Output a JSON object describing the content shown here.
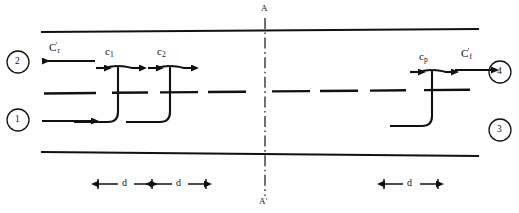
{
  "figure": {
    "type": "engineering-schematic",
    "background": "#fefefe",
    "ink": "#111111"
  },
  "section_line": {
    "top_label": "A",
    "bottom_label": "A'",
    "style": "dash-dot"
  },
  "stations": [
    {
      "id": "station-2",
      "number": "2",
      "cx": 18,
      "cy": 62,
      "r": 11
    },
    {
      "id": "station-1",
      "number": "1",
      "cx": 18,
      "cy": 120,
      "r": 11
    },
    {
      "id": "station-4",
      "number": "4",
      "cx": 500,
      "cy": 72,
      "r": 11
    },
    {
      "id": "station-3",
      "number": "3",
      "cx": 500,
      "cy": 130,
      "r": 11
    }
  ],
  "velocity_labels": [
    {
      "id": "c-r-prime",
      "base": "C",
      "prime": "'",
      "sub": "r",
      "x": 49,
      "y": 42,
      "arrow": "left"
    },
    {
      "id": "c-1",
      "base": "c",
      "prime": "",
      "sub": "1",
      "x": 105,
      "y": 46,
      "arrow": "both"
    },
    {
      "id": "c-2",
      "base": "c",
      "prime": "",
      "sub": "2",
      "x": 156,
      "y": 46,
      "arrow": "both"
    },
    {
      "id": "c-p",
      "base": "c",
      "prime": "",
      "sub": "p",
      "x": 418,
      "y": 51,
      "arrow": "both"
    },
    {
      "id": "c-f-prime",
      "base": "C",
      "prime": "'",
      "sub": "f",
      "x": 461,
      "y": 48,
      "arrow": "right"
    }
  ],
  "dimensions": [
    {
      "id": "dim-d-1",
      "label": "d",
      "x1": 98,
      "x2": 152,
      "y": 184
    },
    {
      "id": "dim-d-2",
      "label": "d",
      "x1": 152,
      "x2": 206,
      "y": 184
    },
    {
      "id": "dim-d-3",
      "label": "d",
      "x1": 384,
      "x2": 438,
      "y": 184
    }
  ],
  "walls": {
    "top": {
      "x1": 42,
      "y1": 32,
      "x2": 478,
      "y2": 29
    },
    "bottom": {
      "x1": 42,
      "y1": 152,
      "x2": 478,
      "y2": 156
    }
  },
  "centerline": {
    "x": 265,
    "y1": 18,
    "y2": 196
  },
  "partition": {
    "description": "dashed mid-channel line",
    "y": 92,
    "segments": [
      [
        44,
        96
      ],
      [
        112,
        148
      ],
      [
        160,
        198
      ],
      [
        208,
        246
      ],
      [
        272,
        310
      ],
      [
        320,
        358
      ],
      [
        370,
        406
      ],
      [
        424,
        470
      ]
    ]
  }
}
